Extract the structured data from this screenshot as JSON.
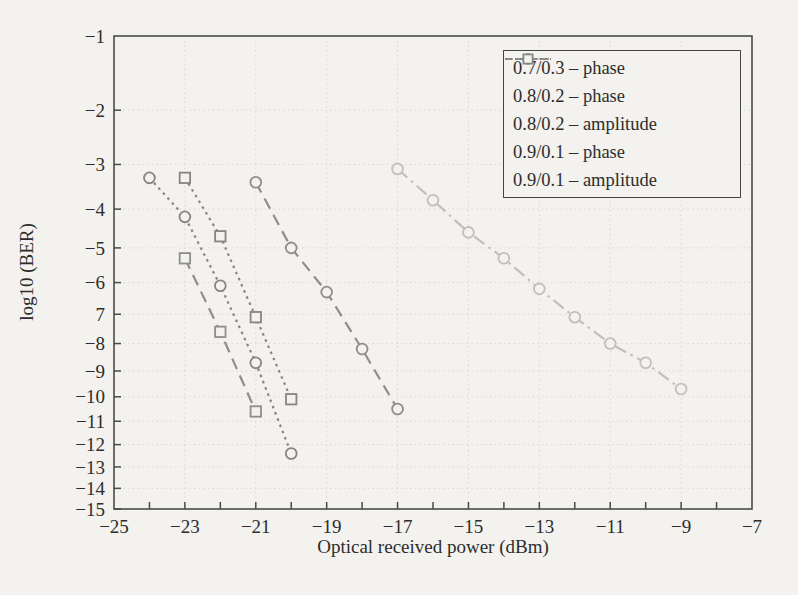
{
  "figure": {
    "background": "#f3f2ee",
    "frame_color": "#4a4a4a",
    "grid_color": "#d8d7d0",
    "text_color": "#2d2d2d"
  },
  "chart_data": {
    "type": "line",
    "title": "",
    "xlabel": "Optical received power (dBm)",
    "ylabel": "log10 (BER)",
    "x_axis": {
      "min": -25,
      "max": -7,
      "tick_values": [
        -25,
        -23,
        -21,
        -19,
        -17,
        -15,
        -13,
        -11,
        -9,
        -7
      ],
      "tick_labels": [
        "−25",
        "−23",
        "−21",
        "−19",
        "−17",
        "−15",
        "−13",
        "−11",
        "−9",
        "−7"
      ],
      "minor_tick_step": 1
    },
    "y_axis": {
      "min": -15,
      "max": -1,
      "scale": "normal-probability (Q-scale) of BER = 10^y",
      "tick_values": [
        -1,
        -2,
        -3,
        -4,
        -5,
        -6,
        -7,
        -8,
        -9,
        -10,
        -11,
        -12,
        -13,
        -14,
        -15
      ],
      "tick_labels": [
        "−1",
        "−2",
        "−3",
        "−4",
        "−5",
        "−6",
        "7",
        "−8",
        "−9",
        "−10",
        "−11",
        "−12",
        "−13",
        "−14",
        "−15"
      ]
    },
    "grid": true,
    "legend_position": "top-right",
    "series": [
      {
        "name": "0.7/0.3 – phase",
        "marker": "circle",
        "linestyle": "dashdot",
        "color": "#c1c0bd",
        "points": [
          [
            -17,
            -3.1
          ],
          [
            -16,
            -3.8
          ],
          [
            -15,
            -4.6
          ],
          [
            -14,
            -5.3
          ],
          [
            -13,
            -6.2
          ],
          [
            -12,
            -7.1
          ],
          [
            -11,
            -8.0
          ],
          [
            -10,
            -8.7
          ],
          [
            -9,
            -9.7
          ]
        ]
      },
      {
        "name": "0.8/0.2 – phase",
        "marker": "circle",
        "linestyle": "dashed",
        "color": "#8f8e8b",
        "points": [
          [
            -21,
            -3.4
          ],
          [
            -20,
            -5.0
          ],
          [
            -19,
            -6.3
          ],
          [
            -18,
            -8.2
          ],
          [
            -17,
            -10.5
          ]
        ]
      },
      {
        "name": "0.8/0.2 – amplitude",
        "marker": "square",
        "linestyle": "dashed",
        "color": "#8f8e8b",
        "points": [
          [
            -23,
            -5.3
          ],
          [
            -22,
            -7.6
          ],
          [
            -21,
            -10.6
          ]
        ]
      },
      {
        "name": "0.9/0.1 – phase",
        "marker": "circle",
        "linestyle": "dotted",
        "color": "#868581",
        "points": [
          [
            -24,
            -3.3
          ],
          [
            -23,
            -4.2
          ],
          [
            -22,
            -6.1
          ],
          [
            -21,
            -8.7
          ],
          [
            -20,
            -12.4
          ]
        ]
      },
      {
        "name": "0.9/0.1 – amplitude",
        "marker": "square",
        "linestyle": "dotted",
        "color": "#868581",
        "points": [
          [
            -23,
            -3.3
          ],
          [
            -22,
            -4.7
          ],
          [
            -21,
            -7.1
          ],
          [
            -20,
            -10.1
          ]
        ]
      }
    ]
  }
}
